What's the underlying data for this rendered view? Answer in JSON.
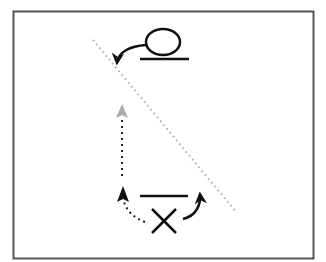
{
  "diagram": {
    "frame": {
      "stroke": "#555555"
    },
    "symbols": [
      {
        "name": "circle-symbol",
        "label": "O"
      },
      {
        "name": "cross-symbol",
        "label": "X"
      }
    ],
    "colors": {
      "ink": "#111111",
      "dotted_line": "#aaaaaa",
      "gray_arrow": "#aaaaaa"
    }
  }
}
